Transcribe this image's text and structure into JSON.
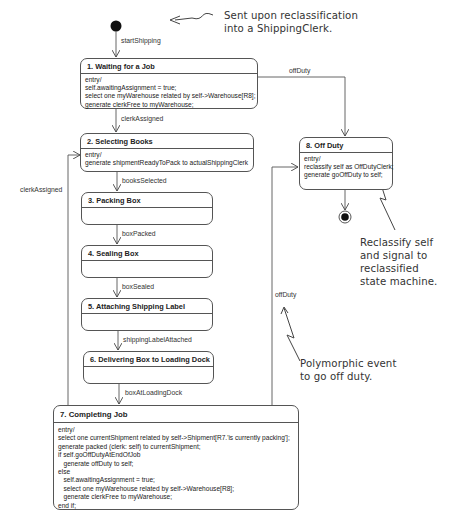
{
  "diagram": {
    "type": "UML state machine",
    "initial_transition": {
      "label": "startShipping"
    },
    "states": [
      {
        "id": 1,
        "title": "1.  Waiting for a Job",
        "body": "entry/\nself.awaitingAssignment = true;\nselect one myWarehouse related by self->Warehouse[R8];\ngenerate clerkFree to myWarehouse;"
      },
      {
        "id": 2,
        "title": "2.  Selecting Books",
        "body": "entry/\ngenerate shipmentReadyToPack to actualShippingClerk"
      },
      {
        "id": 3,
        "title": "3.  Packing Box",
        "body": ""
      },
      {
        "id": 4,
        "title": "4.  Sealing Box",
        "body": ""
      },
      {
        "id": 5,
        "title": "5.  Attaching Shipping Label",
        "body": ""
      },
      {
        "id": 6,
        "title": "6.  Delivering Box to Loading Dock",
        "body": ""
      },
      {
        "id": 7,
        "title": "7.  Completing Job",
        "body": "entry/\nselect one currentShipment related by self->Shipment[R7.'is currently packing'];\ngenerate packed (clerk: self) to currentShipment;\nif self.goOffDutyAtEndOfJob\n   generate offDuty to self;\nelse\n   self.awaitingAssignment = true;\n   select one myWarehouse related by self->Warehouse[R8];\n   generate clerkFree to myWarehouse;\nend if;"
      },
      {
        "id": 8,
        "title": "8.  Off Duty",
        "body": "entry/\nreclassify self as OffDutyClerk;\ngenerate goOffDuty to self;"
      }
    ],
    "transitions": {
      "t1_2": "clerkAssigned",
      "t2_3": "booksSelected",
      "t3_4": "boxPacked",
      "t4_5": "boxSealed",
      "t5_6": "shippingLabelAttached",
      "t6_7": "boxAtLoadingDock",
      "t7_2": "clerkAssigned",
      "t1_8": "offDuty",
      "t7_8": "offDuty"
    },
    "annotations": {
      "reclassification": "Sent upon reclassification\ninto a ShippingClerk.",
      "reclassify_self": "Reclassify self\nand signal to\nreclassified\nstate machine.",
      "polymorphic": "Polymorphic event\nto go off duty."
    }
  }
}
